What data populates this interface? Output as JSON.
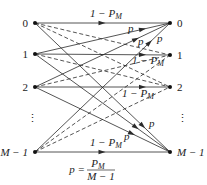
{
  "diagram": {
    "colors": {
      "line": "#2a2a2a",
      "node": "#111111",
      "background": "#ffffff"
    },
    "left_nodes": [
      {
        "id": "L0",
        "label": "0",
        "x": 35,
        "y": 23
      },
      {
        "id": "L1",
        "label": "1",
        "x": 35,
        "y": 54
      },
      {
        "id": "L2",
        "label": "2",
        "x": 35,
        "y": 87
      },
      {
        "id": "LM",
        "label": "M − 1",
        "x": 35,
        "y": 152
      }
    ],
    "right_nodes": [
      {
        "id": "R0",
        "label": "0",
        "x": 170,
        "y": 23
      },
      {
        "id": "R1",
        "label": "1",
        "x": 170,
        "y": 55
      },
      {
        "id": "R2",
        "label": "2",
        "x": 170,
        "y": 87
      },
      {
        "id": "RM",
        "label": "M − 1",
        "x": 170,
        "y": 152
      }
    ],
    "ellipsis": {
      "symbol": "⋮",
      "left": {
        "x": 27,
        "y": 122
      },
      "right": {
        "x": 177,
        "y": 122
      }
    },
    "edges": [
      {
        "from": "L0",
        "to": "R0",
        "style": "solid",
        "arrow_t": 0.5
      },
      {
        "from": "L0",
        "to": "R1",
        "style": "dashed"
      },
      {
        "from": "L0",
        "to": "R2",
        "style": "dashed"
      },
      {
        "from": "L0",
        "to": "RM",
        "style": "solid",
        "arrow_t": 0.8
      },
      {
        "from": "L1",
        "to": "R0",
        "style": "solid",
        "arrow_t": 0.8
      },
      {
        "from": "L1",
        "to": "R1",
        "style": "solid",
        "arrow_t": 0.8
      },
      {
        "from": "L1",
        "to": "R2",
        "style": "dashed"
      },
      {
        "from": "L1",
        "to": "RM",
        "style": "solid",
        "arrow_t": 0.75
      },
      {
        "from": "L2",
        "to": "R0",
        "style": "solid",
        "arrow_t": 0.75
      },
      {
        "from": "L2",
        "to": "R1",
        "style": "dashed"
      },
      {
        "from": "L2",
        "to": "R2",
        "style": "solid",
        "arrow_t": 0.8
      },
      {
        "from": "L2",
        "to": "RM",
        "style": "solid",
        "arrow_t": 0.72
      },
      {
        "from": "LM",
        "to": "R0",
        "style": "solid",
        "arrow_t": 0.85
      },
      {
        "from": "LM",
        "to": "R1",
        "style": "dashed"
      },
      {
        "from": "LM",
        "to": "R2",
        "style": "dashed"
      },
      {
        "from": "LM",
        "to": "RM",
        "style": "solid",
        "arrow_t": 0.5
      }
    ],
    "edge_labels": [
      {
        "text": "1 − P",
        "sub": "M",
        "x": 90,
        "y": 17
      },
      {
        "text": "p",
        "sub": "",
        "x": 128,
        "y": 32
      },
      {
        "text": "p",
        "sub": "",
        "x": 138,
        "y": 45
      },
      {
        "text": "p",
        "sub": "",
        "x": 157,
        "y": 42
      },
      {
        "text": "1 − P",
        "sub": "M",
        "x": 132,
        "y": 64
      },
      {
        "text": "1 − P",
        "sub": "M",
        "x": 122,
        "y": 97
      },
      {
        "text": "p",
        "sub": "",
        "x": 149,
        "y": 127
      },
      {
        "text": "p",
        "sub": "",
        "x": 124,
        "y": 140
      },
      {
        "text": "1 − P",
        "sub": "M",
        "x": 90,
        "y": 146
      }
    ],
    "formula": {
      "lhs": "p =",
      "numerator": "P",
      "numerator_sub": "M",
      "denominator": "M − 1",
      "x": 85,
      "y": 170
    }
  }
}
